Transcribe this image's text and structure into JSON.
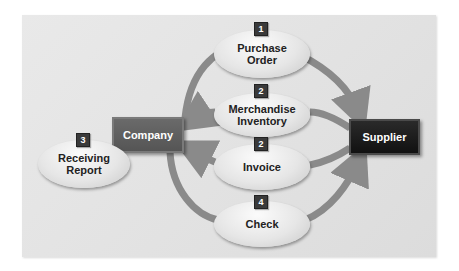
{
  "diagram": {
    "title": "",
    "entities": {
      "company": {
        "label": "Company",
        "color": "#5a5a5a"
      },
      "supplier": {
        "label": "Supplier",
        "color": "#1a1a1a"
      }
    },
    "documents": [
      {
        "step": "1",
        "label_line1": "Purchase",
        "label_line2": "Order",
        "flow": "Company to Supplier"
      },
      {
        "step": "2",
        "label_line1": "Merchandise",
        "label_line2": "Inventory",
        "flow": "Supplier to Company"
      },
      {
        "step": "2",
        "label_line1": "Invoice",
        "label_line2": "",
        "flow": "Supplier to Company"
      },
      {
        "step": "3",
        "label_line1": "Receiving",
        "label_line2": "Report",
        "flow": "Internal to Company"
      },
      {
        "step": "4",
        "label_line1": "Check",
        "label_line2": "",
        "flow": "Company to Supplier"
      }
    ],
    "colors": {
      "arrow": "#8a8a8a",
      "panel_bg": "#e4e4e4",
      "badge": "#3a3a3a"
    }
  }
}
